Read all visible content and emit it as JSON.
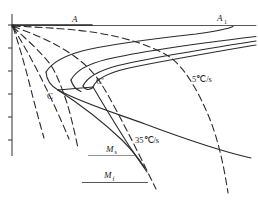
{
  "figure": {
    "type": "cct-ttt-transformation-diagram",
    "labels": {
      "austenite": "A",
      "a1": {
        "base": "A",
        "sub": "1"
      },
      "nose_ttt": "C",
      "nose_cct": "C′",
      "cooling_rate_slow": "5℃/s",
      "cooling_rate_fast": "35℃/s",
      "martensite_start": {
        "base": "M",
        "sub": "s"
      },
      "martensite_finish": {
        "base": "M",
        "sub": "f"
      }
    },
    "colors": {
      "line": "#2b2b2b",
      "axis": "#333333",
      "ms_line": "#8a8a8a",
      "background": "#ffffff"
    },
    "curves": {
      "solid": [
        "a1-temperature-line",
        "austenite-bold-segment",
        "ttt-start-upper-branch",
        "ttt-start-nose",
        "c-curve-2-upper-branch",
        "c-curve-2-nose",
        "c-curve-3-upper-branch",
        "c-curve-3-nose",
        "cct-start-upper-branch",
        "c-to-c-prime-segment",
        "lower-branch-sweep",
        "critical-line-from-c",
        "critical-line-from-c-prime",
        "ms-line",
        "mf-line"
      ],
      "dashed": [
        "cooling-curve-fastest",
        "cooling-curve-fast",
        "cooling-curve-through-c",
        "cooling-curve-35c-per-s",
        "cooling-curve-5c-per-s"
      ]
    }
  }
}
